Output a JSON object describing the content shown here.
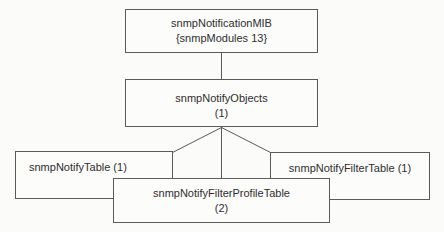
{
  "diagram": {
    "nodes": {
      "notification_mib": {
        "line1": "snmpNotificationMIB",
        "line2": "{snmpModules 13}"
      },
      "notify_objects": {
        "line1": "snmpNotifyObjects",
        "line2": "(1)"
      },
      "notify_table": {
        "label": "snmpNotifyTable (1)"
      },
      "notify_filter_profile_table": {
        "line1": "snmpNotifyFilterProfileTable",
        "line2": "(2)"
      },
      "notify_filter_table": {
        "label": "snmpNotifyFilterTable (1)"
      }
    },
    "colors": {
      "line": "#5a5a5a",
      "text": "#2e2e2e",
      "bg": "#fbfbfa",
      "box-bg": "#fcfcfb"
    }
  }
}
